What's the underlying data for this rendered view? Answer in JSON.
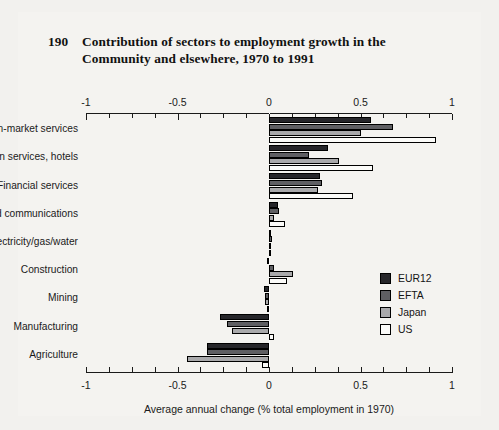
{
  "figure": {
    "number": "190",
    "title_line1": "Contribution of sectors to employment growth in the",
    "title_line2": "Community and elsewhere, 1970 to 1991"
  },
  "legend": {
    "items": [
      {
        "label": "EUR12",
        "color": "#26262a"
      },
      {
        "label": "EFTA",
        "color": "#5f5f63"
      },
      {
        "label": "Japan",
        "color": "#a9a9ab"
      },
      {
        "label": "US",
        "color": "#fbfbf9"
      }
    ]
  },
  "axis": {
    "tick_labels": [
      "-1",
      "-0.5",
      "0",
      "0.5",
      "1"
    ],
    "xlabel": "Average annual change (% total employment in 1970)"
  },
  "chart_data": {
    "type": "bar",
    "orientation": "horizontal",
    "xlabel": "Average annual change (% total employment in 1970)",
    "ylabel": "",
    "xlim": [
      -1,
      1
    ],
    "xticks": [
      -1,
      -0.5,
      0,
      0.5,
      1
    ],
    "xtick_labels": [
      "-1",
      "-0.5",
      "0",
      "0.5",
      "1"
    ],
    "grid": false,
    "axis_top": true,
    "axis_bottom": true,
    "legend_position": "right-middle",
    "categories": [
      "Non-market services",
      "Distribution services, hotels",
      "Financial services",
      "Transport and communications",
      "Electricity/gas/water",
      "Construction",
      "Mining",
      "Manufacturing",
      "Agriculture"
    ],
    "series": [
      {
        "name": "EUR12",
        "color": "#26262a",
        "values": [
          0.56,
          0.32,
          0.28,
          0.05,
          0.01,
          -0.01,
          -0.03,
          -0.27,
          -0.34
        ]
      },
      {
        "name": "EFTA",
        "color": "#5f5f63",
        "values": [
          0.68,
          0.22,
          0.29,
          0.055,
          0.015,
          0.03,
          -0.02,
          -0.23,
          -0.34
        ]
      },
      {
        "name": "Japan",
        "color": "#a9a9ab",
        "values": [
          0.5,
          0.38,
          0.27,
          0.03,
          0.01,
          0.13,
          -0.02,
          -0.2,
          -0.45
        ]
      },
      {
        "name": "US",
        "color": "#fbfbf9",
        "values": [
          0.91,
          0.57,
          0.46,
          0.09,
          0.01,
          0.1,
          -0.01,
          0.03,
          -0.04
        ]
      }
    ]
  }
}
